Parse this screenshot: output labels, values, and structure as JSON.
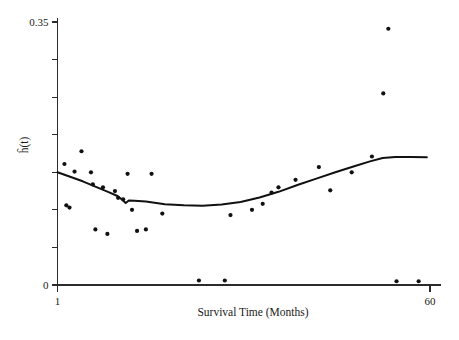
{
  "chart_data": {
    "type": "scatter",
    "title": "",
    "subtitle": "",
    "xlabel": "Survival Time (Months)",
    "ylabel": "ĥ(t)",
    "xlim": [
      1,
      60
    ],
    "ylim": [
      0,
      0.35
    ],
    "grid": false,
    "legend": null,
    "x_tick_labels": [
      "1",
      "60"
    ],
    "x_tick_values": [
      1,
      60
    ],
    "y_tick_labels": [
      "0",
      "",
      "",
      "",
      "",
      "",
      "",
      "0.35"
    ],
    "y_tick_values": [
      0,
      0.05,
      0.1,
      0.15,
      0.2,
      0.25,
      0.3,
      0.35
    ],
    "y_labeled_ticks": [
      {
        "value": 0,
        "label": "0"
      },
      {
        "value": 0.35,
        "label": "0.35"
      }
    ],
    "series": [
      {
        "name": "observed hazard estimates",
        "type": "scatter",
        "marker": "filled-circle",
        "color": "#111111",
        "points": [
          {
            "x": 2.1,
            "y": 0.161
          },
          {
            "x": 2.4,
            "y": 0.106
          },
          {
            "x": 2.9,
            "y": 0.103
          },
          {
            "x": 3.7,
            "y": 0.151
          },
          {
            "x": 4.8,
            "y": 0.178
          },
          {
            "x": 6.3,
            "y": 0.15
          },
          {
            "x": 6.6,
            "y": 0.134
          },
          {
            "x": 7.0,
            "y": 0.074
          },
          {
            "x": 8.2,
            "y": 0.13
          },
          {
            "x": 8.9,
            "y": 0.068
          },
          {
            "x": 10.1,
            "y": 0.125
          },
          {
            "x": 10.6,
            "y": 0.116
          },
          {
            "x": 11.4,
            "y": 0.114
          },
          {
            "x": 12.1,
            "y": 0.148
          },
          {
            "x": 12.8,
            "y": 0.1
          },
          {
            "x": 13.6,
            "y": 0.072
          },
          {
            "x": 15.0,
            "y": 0.074
          },
          {
            "x": 15.9,
            "y": 0.148
          },
          {
            "x": 17.6,
            "y": 0.095
          },
          {
            "x": 23.4,
            "y": 0.006
          },
          {
            "x": 27.5,
            "y": 0.006
          },
          {
            "x": 28.4,
            "y": 0.093
          },
          {
            "x": 31.8,
            "y": 0.1
          },
          {
            "x": 33.5,
            "y": 0.108
          },
          {
            "x": 34.9,
            "y": 0.123
          },
          {
            "x": 36.0,
            "y": 0.13
          },
          {
            "x": 38.7,
            "y": 0.14
          },
          {
            "x": 42.4,
            "y": 0.157
          },
          {
            "x": 44.2,
            "y": 0.126
          },
          {
            "x": 47.6,
            "y": 0.15
          },
          {
            "x": 50.8,
            "y": 0.171
          },
          {
            "x": 52.6,
            "y": 0.255
          },
          {
            "x": 53.4,
            "y": 0.341
          },
          {
            "x": 54.7,
            "y": 0.005
          },
          {
            "x": 58.2,
            "y": 0.005
          }
        ]
      },
      {
        "name": "smoothed hazard curve",
        "type": "line",
        "color": "#111111",
        "points": [
          {
            "x": 1.0,
            "y": 0.15
          },
          {
            "x": 3.0,
            "y": 0.144
          },
          {
            "x": 5.0,
            "y": 0.138
          },
          {
            "x": 7.0,
            "y": 0.131
          },
          {
            "x": 9.0,
            "y": 0.124
          },
          {
            "x": 10.5,
            "y": 0.1185
          },
          {
            "x": 11.3,
            "y": 0.113
          },
          {
            "x": 11.8,
            "y": 0.109
          },
          {
            "x": 12.3,
            "y": 0.1125
          },
          {
            "x": 13.2,
            "y": 0.112
          },
          {
            "x": 15.0,
            "y": 0.111
          },
          {
            "x": 18.0,
            "y": 0.1075
          },
          {
            "x": 21.0,
            "y": 0.106
          },
          {
            "x": 24.0,
            "y": 0.1055
          },
          {
            "x": 27.0,
            "y": 0.107
          },
          {
            "x": 30.0,
            "y": 0.1105
          },
          {
            "x": 33.0,
            "y": 0.1165
          },
          {
            "x": 36.0,
            "y": 0.124
          },
          {
            "x": 39.0,
            "y": 0.133
          },
          {
            "x": 42.0,
            "y": 0.1415
          },
          {
            "x": 45.0,
            "y": 0.15
          },
          {
            "x": 48.0,
            "y": 0.158
          },
          {
            "x": 50.5,
            "y": 0.1645
          },
          {
            "x": 52.5,
            "y": 0.169
          },
          {
            "x": 54.5,
            "y": 0.1705
          },
          {
            "x": 57.0,
            "y": 0.1705
          },
          {
            "x": 59.5,
            "y": 0.17
          }
        ]
      }
    ]
  }
}
